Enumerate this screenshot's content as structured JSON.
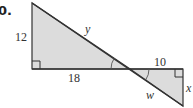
{
  "problem": {
    "number_label": "0."
  },
  "figure": {
    "fill_color": "#dcdcdc",
    "stroke_color": "#333333",
    "upper_triangle": {
      "left_leg_label": "12",
      "bottom_leg_label": "18",
      "hypotenuse_label": "y",
      "right_angle": "bottom-left"
    },
    "lower_triangle": {
      "top_leg_label": "10",
      "right_leg_label": "x",
      "hypotenuse_label": "w",
      "right_angle": "top-right"
    },
    "vertical_angles": "marked congruent at intersection"
  }
}
